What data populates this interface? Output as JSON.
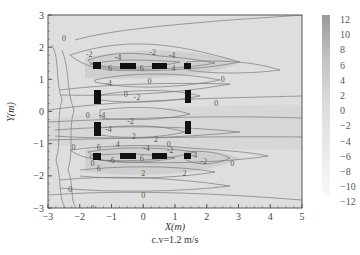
{
  "chart_data": {
    "type": "heatmap",
    "subtype": "contour",
    "title": "",
    "xlabel": "X(m)",
    "ylabel": "Y(m)",
    "caption": "c.v=1.2 m/s",
    "xlim": [
      -3,
      5
    ],
    "ylim": [
      -3,
      3
    ],
    "x_ticks": [
      "-3",
      "-2",
      "-1",
      "0",
      "1",
      "2",
      "3",
      "4",
      "5"
    ],
    "y_ticks": [
      "3",
      "2",
      "1",
      "0",
      "-1",
      "-2",
      "-3"
    ],
    "grid": false,
    "colorbar": {
      "position": "right",
      "labels": [
        "12",
        "10",
        "8",
        "6",
        "4",
        "2",
        "0",
        "-2",
        "-4",
        "-6",
        "-8",
        "-10",
        "-12"
      ],
      "range": [
        -12,
        12
      ],
      "colormap": "grayscale (dark = high)"
    },
    "contour_labels": [
      "-2",
      "-4",
      "0",
      "2",
      "4",
      "6"
    ],
    "obstacles": [
      {
        "row": "top",
        "y": 1.4,
        "x": [
          -1.5,
          -0.6,
          0.4,
          1.35
        ]
      },
      {
        "row": "bottom",
        "y": -1.4,
        "x": [
          -1.5,
          -0.6,
          0.4,
          1.35
        ]
      },
      {
        "column": "left",
        "x": -1.5,
        "y": [
          0.5,
          -0.5
        ]
      },
      {
        "column": "right",
        "x": 1.35,
        "y": [
          0.5,
          -0.5
        ]
      }
    ],
    "annotations": [
      {
        "text": "0",
        "x": -2.5,
        "y": 2.3
      },
      {
        "text": "-2",
        "x": -1.7,
        "y": 1.8
      },
      {
        "text": "-4",
        "x": -0.8,
        "y": 1.7
      },
      {
        "text": "-2",
        "x": 0.3,
        "y": 1.85
      },
      {
        "text": "-4",
        "x": 0.9,
        "y": 1.75
      },
      {
        "text": "6",
        "x": -1.05,
        "y": 1.35
      },
      {
        "text": "6",
        "x": -0.05,
        "y": 1.35
      },
      {
        "text": "4",
        "x": 0.95,
        "y": 1.35
      },
      {
        "text": "0",
        "x": 2.5,
        "y": 1.0
      },
      {
        "text": "0",
        "x": 0.2,
        "y": 0.95
      },
      {
        "text": "-2",
        "x": -0.2,
        "y": 0.45
      },
      {
        "text": "-4",
        "x": -1.1,
        "y": 0.9
      },
      {
        "text": "0",
        "x": -0.55,
        "y": 0.55
      },
      {
        "text": "0",
        "x": 2.3,
        "y": 0.25
      },
      {
        "text": "-4",
        "x": -1.3,
        "y": -0.1
      },
      {
        "text": "0",
        "x": -1.75,
        "y": -0.1
      },
      {
        "text": "-2",
        "x": -0.4,
        "y": -0.3
      },
      {
        "text": "2",
        "x": -0.3,
        "y": -0.75
      },
      {
        "text": "-4",
        "x": -1.1,
        "y": -0.55
      },
      {
        "text": "4",
        "x": -0.8,
        "y": -1.0
      },
      {
        "text": "2",
        "x": 0.4,
        "y": -0.85
      },
      {
        "text": "0",
        "x": 0.8,
        "y": -1.0
      },
      {
        "text": "0",
        "x": -2.2,
        "y": -1.1
      },
      {
        "text": "6",
        "x": -1.4,
        "y": -1.1
      },
      {
        "text": "-4",
        "x": 0.1,
        "y": -1.15
      },
      {
        "text": "-6",
        "x": -1.0,
        "y": -1.5
      },
      {
        "text": "6",
        "x": -0.05,
        "y": -1.45
      },
      {
        "text": "-2",
        "x": 0.85,
        "y": -1.2
      },
      {
        "text": "0",
        "x": -1.6,
        "y": -1.6
      },
      {
        "text": "6",
        "x": -1.4,
        "y": -1.75
      },
      {
        "text": "-4",
        "x": 1.6,
        "y": -1.35
      },
      {
        "text": "-2",
        "x": 1.9,
        "y": -1.55
      },
      {
        "text": "2",
        "x": 0.0,
        "y": -1.9
      },
      {
        "text": "2",
        "x": 1.3,
        "y": -1.9
      },
      {
        "text": "0",
        "x": 2.8,
        "y": -1.6
      },
      {
        "text": "0",
        "x": -2.3,
        "y": -2.4
      },
      {
        "text": "0",
        "x": 0.0,
        "y": -2.6
      },
      {
        "text": "0",
        "x": -1.6,
        "y": -3.0
      }
    ]
  }
}
